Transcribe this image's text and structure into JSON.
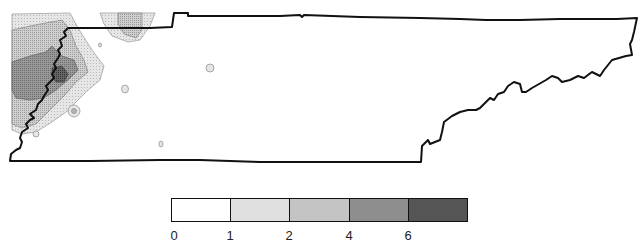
{
  "map": {
    "region": "Tennessee",
    "shading_colors": [
      "#ffffff",
      "#e0e0e0",
      "#c4c4c4",
      "#8e8e8e",
      "#555555"
    ],
    "outline_color": "#111111"
  },
  "legend": {
    "bins": [
      {
        "from": "0",
        "to": "1",
        "color": "#ffffff"
      },
      {
        "from": "1",
        "to": "2",
        "color": "#e0e0e0"
      },
      {
        "from": "2",
        "to": "4",
        "color": "#c4c4c4"
      },
      {
        "from": "4",
        "to": "6",
        "color": "#8e8e8e"
      },
      {
        "from": "6",
        "to": "",
        "color": "#555555"
      }
    ],
    "tick_labels": [
      "0",
      "1",
      "2",
      "4",
      "6"
    ]
  }
}
